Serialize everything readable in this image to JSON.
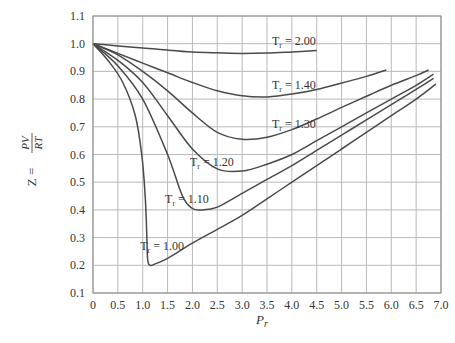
{
  "chart_data": {
    "type": "line",
    "title": "",
    "xlabel": "P_r",
    "ylabel": "Z = PV/RT",
    "xlim": [
      0,
      7.0
    ],
    "ylim": [
      0.1,
      1.1
    ],
    "grid": true,
    "x_ticks": [
      "0",
      "0.5",
      "1.0",
      "1.5",
      "2.0",
      "2.5",
      "3.0",
      "3.5",
      "4.0",
      "4.5",
      "5.0",
      "5.5",
      "6.0",
      "6.5",
      "7.0"
    ],
    "y_ticks": [
      "0.1",
      "0.2",
      "0.3",
      "0.4",
      "0.5",
      "0.6",
      "0.7",
      "0.8",
      "0.9",
      "1.0",
      "1.1"
    ],
    "series": [
      {
        "name": "Tr = 2.00",
        "label": "= 2.00",
        "label_pos": [
          3.6,
          0.995
        ],
        "x": [
          0,
          0.5,
          1,
          1.5,
          2,
          2.5,
          3,
          3.5,
          4,
          4.5
        ],
        "y": [
          1.0,
          0.992,
          0.985,
          0.977,
          0.97,
          0.967,
          0.965,
          0.966,
          0.97,
          0.975
        ]
      },
      {
        "name": "Tr = 1.40",
        "label": "= 1.40",
        "label_pos": [
          3.6,
          0.835
        ],
        "x": [
          0,
          0.5,
          1,
          1.5,
          2,
          2.5,
          3,
          3.5,
          4,
          4.5,
          5,
          5.5,
          5.9
        ],
        "y": [
          1.0,
          0.965,
          0.93,
          0.895,
          0.86,
          0.83,
          0.812,
          0.808,
          0.818,
          0.835,
          0.858,
          0.882,
          0.905
        ]
      },
      {
        "name": "Tr = 1.30",
        "label": "= 1.30",
        "label_pos": [
          3.6,
          0.695
        ],
        "x": [
          0,
          0.5,
          1,
          1.5,
          2,
          2.5,
          3,
          3.5,
          4,
          4.5,
          5,
          5.5,
          6,
          6.5,
          6.75
        ],
        "y": [
          1.0,
          0.96,
          0.9,
          0.83,
          0.75,
          0.68,
          0.655,
          0.662,
          0.69,
          0.728,
          0.77,
          0.81,
          0.85,
          0.885,
          0.905
        ]
      },
      {
        "name": "Tr = 1.20",
        "label": "= 1.20",
        "label_pos": [
          1.95,
          0.56
        ],
        "x": [
          0,
          0.5,
          1,
          1.5,
          2,
          2.5,
          3,
          3.5,
          4,
          4.5,
          5,
          5.5,
          6,
          6.5,
          6.85
        ],
        "y": [
          1.0,
          0.94,
          0.86,
          0.74,
          0.62,
          0.548,
          0.54,
          0.565,
          0.6,
          0.65,
          0.7,
          0.75,
          0.8,
          0.85,
          0.89
        ]
      },
      {
        "name": "Tr = 1.10",
        "label": "= 1.10",
        "label_pos": [
          1.45,
          0.425
        ],
        "x": [
          0,
          0.5,
          1,
          1.5,
          1.8,
          2,
          2.2,
          2.5,
          3,
          3.5,
          4,
          4.5,
          5,
          5.5,
          6,
          6.5,
          6.85
        ],
        "y": [
          1.0,
          0.92,
          0.8,
          0.6,
          0.45,
          0.405,
          0.4,
          0.41,
          0.46,
          0.51,
          0.56,
          0.615,
          0.67,
          0.725,
          0.78,
          0.835,
          0.875
        ]
      },
      {
        "name": "Tr = 1.00",
        "label": "= 1.00",
        "label_pos": [
          0.95,
          0.255
        ],
        "x": [
          0,
          0.3,
          0.6,
          0.85,
          0.98,
          1.05,
          1.08,
          1.1,
          1.15,
          1.25,
          1.5,
          2,
          2.5,
          3,
          3.5,
          4,
          4.5,
          5,
          5.5,
          6,
          6.5,
          6.9
        ],
        "y": [
          1.0,
          0.94,
          0.86,
          0.74,
          0.6,
          0.45,
          0.32,
          0.22,
          0.2,
          0.205,
          0.225,
          0.28,
          0.33,
          0.38,
          0.44,
          0.5,
          0.56,
          0.62,
          0.68,
          0.74,
          0.8,
          0.855
        ]
      }
    ]
  },
  "labels": {
    "y_axis": "Z =",
    "y_axis_frac_num": "PV",
    "y_axis_frac_den": "RT",
    "x_axis": "P",
    "x_axis_sub": "r",
    "curve_prefix": "T",
    "curve_prefix_sub": "r"
  },
  "colors": {
    "curve": "#4a4a4a",
    "grid": "#b9b9b9",
    "text": "#333333",
    "background": "#ffffff"
  }
}
